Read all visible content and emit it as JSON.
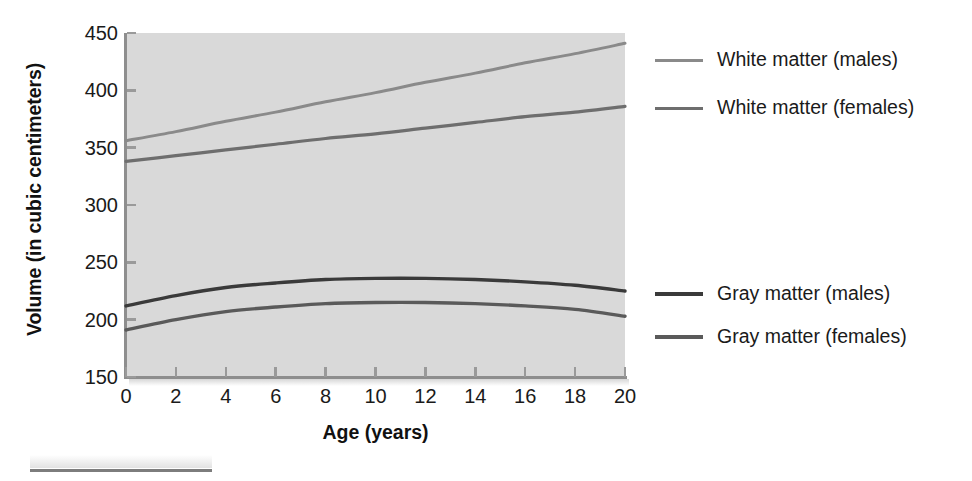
{
  "chart_data": {
    "type": "line",
    "title": "",
    "xlabel": "Age (years)",
    "ylabel": "Volume (in cubic centimeters)",
    "xlim": [
      0,
      20
    ],
    "ylim": [
      150,
      450
    ],
    "xticks": [
      "0",
      "2",
      "4",
      "6",
      "8",
      "10",
      "12",
      "14",
      "16",
      "18",
      "20"
    ],
    "yticks": [
      "150",
      "200",
      "250",
      "300",
      "350",
      "400",
      "450"
    ],
    "grid": false,
    "legend_position": "right",
    "x": [
      0,
      2,
      4,
      6,
      8,
      10,
      12,
      14,
      16,
      18,
      20
    ],
    "series": [
      {
        "name": "White matter (males)",
        "color": "#8a8a8a",
        "width": 3.0,
        "values": [
          356,
          364,
          373,
          381,
          390,
          398,
          407,
          415,
          424,
          432,
          441
        ]
      },
      {
        "name": "White matter (females)",
        "color": "#6e6e6e",
        "width": 3.2,
        "values": [
          338,
          343,
          348,
          353,
          358,
          362,
          367,
          372,
          377,
          381,
          386
        ]
      },
      {
        "name": "Gray matter (males)",
        "color": "#3a3a3a",
        "width": 3.4,
        "values": [
          212,
          221,
          228,
          232,
          235,
          236,
          236,
          235,
          233,
          230,
          225
        ]
      },
      {
        "name": "Gray matter (females)",
        "color": "#5a5a5a",
        "width": 3.4,
        "values": [
          191,
          200,
          207,
          211,
          214,
          215,
          215,
          214,
          212,
          209,
          203
        ]
      }
    ]
  },
  "legend": {
    "items": [
      {
        "label": "White matter (males)",
        "top": 14,
        "color": "#8a8a8a"
      },
      {
        "label": "White matter (females)",
        "top": 62,
        "color": "#6e6e6e"
      },
      {
        "label": "Gray matter (males)",
        "top": 248,
        "color": "#3a3a3a"
      },
      {
        "label": "Gray matter (females)",
        "top": 291,
        "color": "#5a5a5a"
      }
    ]
  },
  "colors": {
    "plot_background": "#d9d9d9",
    "page_background": "#ffffff",
    "axis": "#8e8e8e",
    "text": "#1a1a1a"
  }
}
